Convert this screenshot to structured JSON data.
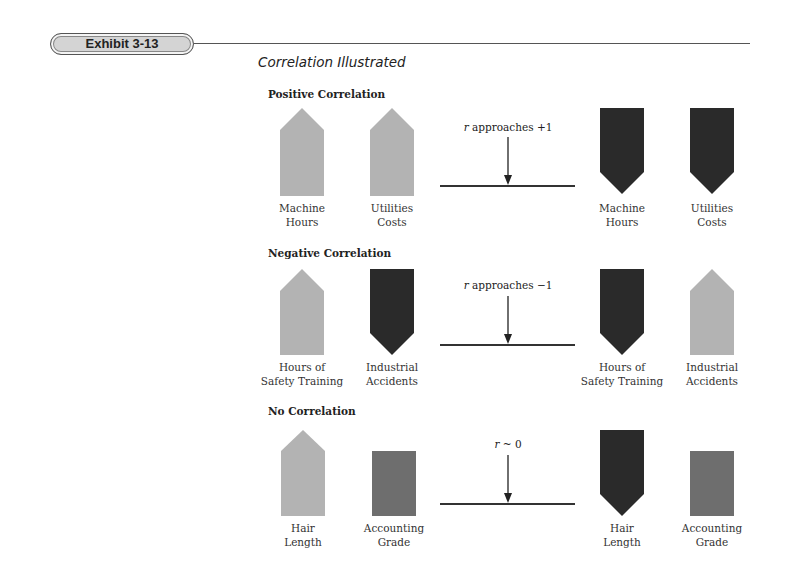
{
  "header": {
    "badge_label": "Exhibit 3-13",
    "title": "Correlation Illustrated"
  },
  "colors": {
    "light": "#b3b3b3",
    "dark": "#2a2a2a",
    "medium": "#6e6e6e",
    "rule": "#444444"
  },
  "sections": [
    {
      "title": "Positive Correlation",
      "caption_var": "r",
      "caption_text": " approaches +1",
      "left": [
        {
          "line1": "Machine",
          "line2": "Hours",
          "shape": "up-light"
        },
        {
          "line1": "Utilities",
          "line2": "Costs",
          "shape": "up-light"
        }
      ],
      "right": [
        {
          "line1": "Machine",
          "line2": "Hours",
          "shape": "down-dark"
        },
        {
          "line1": "Utilities",
          "line2": "Costs",
          "shape": "down-dark"
        }
      ]
    },
    {
      "title": "Negative Correlation",
      "caption_var": "r",
      "caption_text": " approaches −1",
      "left": [
        {
          "line1": "Hours of",
          "line2": "Safety Training",
          "shape": "up-light"
        },
        {
          "line1": "Industrial",
          "line2": "Accidents",
          "shape": "down-dark"
        }
      ],
      "right": [
        {
          "line1": "Hours of",
          "line2": "Safety Training",
          "shape": "down-dark"
        },
        {
          "line1": "Industrial",
          "line2": "Accidents",
          "shape": "up-light"
        }
      ]
    },
    {
      "title": "No Correlation",
      "caption_var": "r",
      "caption_text": " ~ 0",
      "left": [
        {
          "line1": "Hair",
          "line2": "Length",
          "shape": "up-light"
        },
        {
          "line1": "Accounting",
          "line2": "Grade",
          "shape": "rect-medium"
        }
      ],
      "right": [
        {
          "line1": "Hair",
          "line2": "Length",
          "shape": "down-dark"
        },
        {
          "line1": "Accounting",
          "line2": "Grade",
          "shape": "rect-medium"
        }
      ]
    }
  ]
}
